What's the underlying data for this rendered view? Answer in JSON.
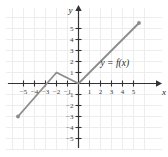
{
  "chart_data": {
    "type": "line",
    "title": "",
    "subtitle": "",
    "xlabel": "x",
    "ylabel": "y",
    "xlim": [
      -6,
      6
    ],
    "ylim": [
      -5.8,
      6
    ],
    "grid": true,
    "legend_position": "inline-annotation",
    "annotations": [
      {
        "text": "y = f(x)",
        "x": 2.0,
        "y": 1.6
      }
    ],
    "xticks": [
      -5,
      -4,
      -3,
      -2,
      -1,
      1,
      2,
      3,
      4,
      5
    ],
    "xtick_labels": [
      "−5",
      "−4",
      "−3",
      "−2",
      "−1",
      "1",
      "2",
      "3",
      "4",
      "5"
    ],
    "yticks": [
      -5,
      -4,
      -3,
      -2,
      -1,
      1,
      2,
      3,
      4,
      5
    ],
    "ytick_labels": [
      "−5",
      "−4",
      "−3",
      "−2",
      "−1",
      "1",
      "2",
      "3",
      "4",
      "5"
    ],
    "series": [
      {
        "name": "f(x)",
        "points": [
          {
            "x": -5.5,
            "y": -3.0
          },
          {
            "x": -2.0,
            "y": 1.0
          },
          {
            "x": 0.0,
            "y": 0.0
          },
          {
            "x": 5.5,
            "y": 5.5
          }
        ],
        "color": "#8c8c8c",
        "endpoint_style": "round-dot"
      }
    ],
    "colors": {
      "grid": "#ededed",
      "axis": "#333333",
      "curve": "#8c8c8c",
      "tick_text": "#3a3a3a",
      "background": "#ffffff"
    }
  },
  "labels": {
    "x_axis": "x",
    "y_axis": "y",
    "function": "y = f(x)"
  }
}
